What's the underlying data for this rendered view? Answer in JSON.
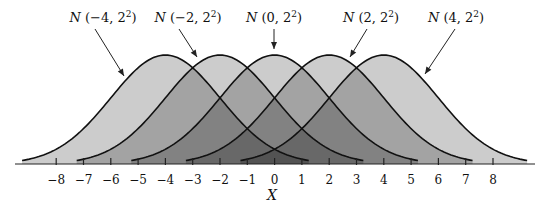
{
  "chart_data": {
    "type": "area",
    "title": "",
    "xlabel": "X",
    "ylabel": "",
    "xlim": [
      -9.2,
      9.3
    ],
    "x_ticks": [
      -8,
      -7,
      -6,
      -5,
      -4,
      -3,
      -2,
      -1,
      0,
      1,
      2,
      3,
      4,
      5,
      6,
      7,
      8
    ],
    "x_tick_labels": [
      "−8",
      "−7",
      "−6",
      "−5",
      "−4",
      "−3",
      "−2",
      "−1",
      "0",
      "1",
      "2",
      "3",
      "4",
      "5",
      "6",
      "7",
      "8"
    ],
    "grid": false,
    "legend": "none (curves annotated with arrow labels above)",
    "series": [
      {
        "name": "N(−4, 2²)",
        "mean": -4,
        "variance": 4,
        "sd": 2
      },
      {
        "name": "N(−2, 2²)",
        "mean": -2,
        "variance": 4,
        "sd": 2
      },
      {
        "name": "N(0, 2²)",
        "mean": 0,
        "variance": 4,
        "sd": 2
      },
      {
        "name": "N(2, 2²)",
        "mean": 2,
        "variance": 4,
        "sd": 2
      },
      {
        "name": "N(4, 2²)",
        "mean": 4,
        "variance": 4,
        "sd": 2
      }
    ],
    "annotations": [
      {
        "text": "N (−4, 2²)",
        "points_to_mean": -4
      },
      {
        "text": "N (−2, 2²)",
        "points_to_mean": -2
      },
      {
        "text": "N (0, 2²)",
        "points_to_mean": 0
      },
      {
        "text": "N (2, 2²)",
        "points_to_mean": 2
      },
      {
        "text": "N (4, 2²)",
        "points_to_mean": 4
      }
    ],
    "colors": {
      "curve_stroke": "#111111",
      "fill": "#000000",
      "fill_opacity": 0.2,
      "axis": "#222222"
    }
  },
  "labels": [
    {
      "prefix": "N",
      "args": " (−4, 2",
      "sup": "2",
      "close": ")"
    },
    {
      "prefix": "N",
      "args": " (−2, 2",
      "sup": "2",
      "close": ")"
    },
    {
      "prefix": "N",
      "args": " (0, 2",
      "sup": "2",
      "close": ")"
    },
    {
      "prefix": "N",
      "args": " (2, 2",
      "sup": "2",
      "close": ")"
    },
    {
      "prefix": "N",
      "args": " (4, 2",
      "sup": "2",
      "close": ")"
    }
  ],
  "axis_title": "X"
}
